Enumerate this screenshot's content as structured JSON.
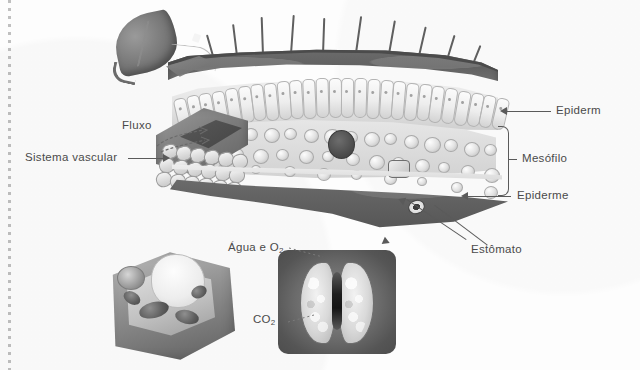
{
  "figure": {
    "kind": "scanned-textbook-illustration",
    "background_color": "#fdfdfd",
    "ink_color": "#4a4a4a"
  },
  "labels": {
    "epiderm_top": "Epiderm",
    "mesofilo": "Mesófilo",
    "epiderme_bottom": "Epiderme",
    "estomato": "Estômato",
    "fluxo": "Fluxo",
    "sistema_vascular": "Sistema vascular",
    "agua_e_o2": "Água e O",
    "agua_e_o2_sub": "2",
    "co2": "CO",
    "co2_sub": "2"
  },
  "panels": {
    "mini_leaf": "leaf-thumbnail",
    "cross_section": "leaf-cross-section",
    "cell_cutaway": "plant-cell-cutaway",
    "stoma_micrograph": "stoma-guard-cells"
  },
  "structures": {
    "trichomes": "leaf-hairs",
    "palisade": "palisade-mesophyll",
    "spongy": "spongy-mesophyll",
    "vascular_bundle": "vascular-bundle",
    "stoma_pore": "stomatal-pore"
  }
}
